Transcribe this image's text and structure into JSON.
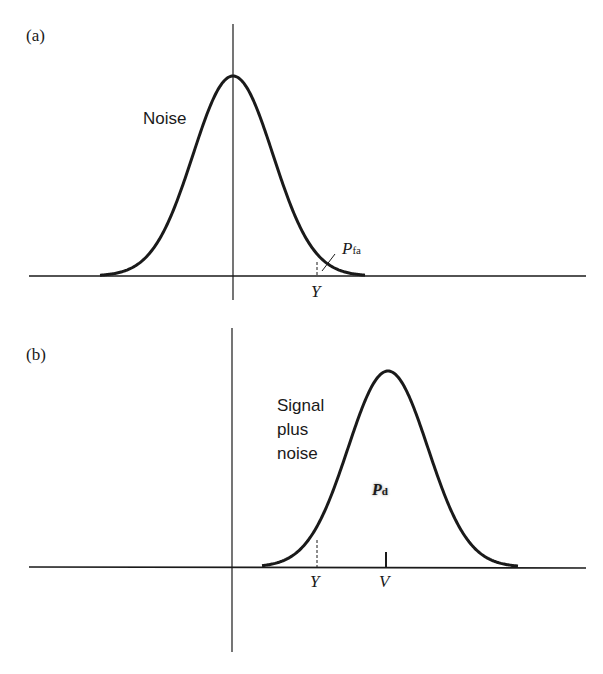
{
  "panels": [
    {
      "id": "a",
      "label": "(a)",
      "curve_label": "Noise",
      "area_label_main": "P",
      "area_label_sub": "fa",
      "threshold_label": "Y"
    },
    {
      "id": "b",
      "label": "(b)",
      "curve_label_lines": [
        "Signal",
        "plus",
        "noise"
      ],
      "area_label_main": "P",
      "area_label_sub": "d",
      "threshold_label": "Y",
      "mean_label": "V"
    }
  ],
  "chart_data": [
    {
      "type": "line",
      "title": "(a)",
      "series": [
        {
          "name": "Noise",
          "distribution": "gaussian",
          "mean": 0
        }
      ],
      "annotations": [
        "Noise",
        "P_fa",
        "Y"
      ],
      "threshold": "Y",
      "shaded_region": "P_fa (tail beyond Y)",
      "grid": false
    },
    {
      "type": "line",
      "title": "(b)",
      "series": [
        {
          "name": "Signal plus noise",
          "distribution": "gaussian",
          "mean": "V"
        }
      ],
      "annotations": [
        "Signal plus noise",
        "P_d",
        "Y",
        "V"
      ],
      "threshold": "Y",
      "shaded_region": "P_d (area beyond Y)",
      "grid": false
    }
  ],
  "colors": {
    "ink": "#1a1a1a",
    "background": "#ffffff"
  }
}
